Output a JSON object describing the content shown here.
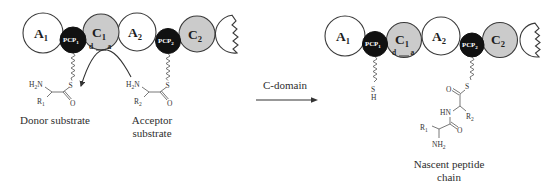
{
  "left_module": {
    "domains": [
      {
        "name": "A",
        "sub": "1"
      },
      {
        "name": "PCP",
        "sub": "1"
      },
      {
        "name": "C",
        "sub": "1"
      },
      {
        "name": "A",
        "sub": "2"
      },
      {
        "name": "PCP",
        "sub": "2"
      },
      {
        "name": "C",
        "sub": "2"
      }
    ],
    "c1_site_donor": "d",
    "c1_site_acceptor": "a",
    "donor": {
      "h": "H",
      "h_sub": "2",
      "n": "N",
      "r": "R",
      "r_sub": "1",
      "s": "S",
      "o": "O",
      "label": "Donor substrate"
    },
    "acceptor": {
      "h": "H",
      "h_sub": "2",
      "n": "N",
      "r": "R",
      "r_sub": "2",
      "s": "S",
      "o": "O",
      "label_line1": "Acceptor",
      "label_line2": "substrate"
    }
  },
  "reaction": {
    "label": "C-domain"
  },
  "right_module": {
    "domains": [
      {
        "name": "A",
        "sub": "1"
      },
      {
        "name": "PCP",
        "sub": "1"
      },
      {
        "name": "C",
        "sub": "1"
      },
      {
        "name": "A",
        "sub": "2"
      },
      {
        "name": "PCP",
        "sub": "2"
      },
      {
        "name": "C",
        "sub": "2"
      }
    ],
    "c1_site_donor": "d",
    "c1_site_acceptor": "a",
    "free_thiol": {
      "s": "S",
      "h": "H"
    },
    "peptide": {
      "s": "S",
      "o1": "O",
      "hn": "HN",
      "r2": "R",
      "r2_sub": "2",
      "o2": "O",
      "r1": "R",
      "r1_sub": "1",
      "nh": "NH",
      "nh_sub": "2",
      "label_line1": "Nascent peptide",
      "label_line2": "chain"
    }
  },
  "colors": {
    "a_domain": "#ffffff",
    "c_domain": "#cbcbcb",
    "pcp_domain": "#111111",
    "outline": "#3a3a3a",
    "text": "#2a2a2a",
    "pcp_text": "#ffffff"
  }
}
